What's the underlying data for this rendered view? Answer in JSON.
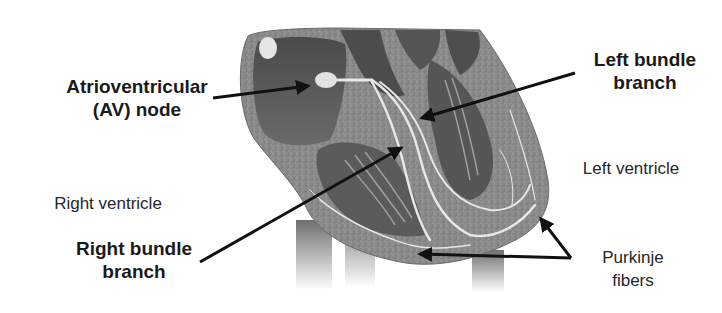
{
  "diagram": {
    "colors": {
      "background": "#ffffff",
      "label_text": "#1a1a1a",
      "arrow": "#111111",
      "heart_wall": "#8c8c8c",
      "heart_chamber": "#5a5a5a",
      "conduction_path": "#e6e6e6"
    },
    "labels": {
      "av_node": {
        "line1": "Atrioventricular",
        "line2": "(AV) node"
      },
      "left_bundle": {
        "line1": "Left bundle",
        "line2": "branch"
      },
      "left_ventricle": {
        "text": "Left ventricle"
      },
      "right_ventricle": {
        "text": "Right ventricle"
      },
      "right_bundle": {
        "line1": "Right bundle",
        "line2": "branch"
      },
      "purkinje": {
        "line1": "Purkinje",
        "line2": "fibers"
      }
    },
    "arrows": [
      {
        "name": "av-node-arrow",
        "from": [
          213,
          98
        ],
        "to": [
          310,
          86
        ]
      },
      {
        "name": "left-bundle-arrow",
        "from": [
          575,
          73
        ],
        "to": [
          420,
          118
        ]
      },
      {
        "name": "right-bundle-arrow",
        "from": [
          200,
          262
        ],
        "to": [
          403,
          147
        ]
      },
      {
        "name": "purkinje-arrow-upper",
        "from": [
          571,
          258
        ],
        "to": [
          540,
          217
        ]
      },
      {
        "name": "purkinje-arrow-lower",
        "from": [
          571,
          258
        ],
        "to": [
          418,
          254
        ]
      }
    ]
  }
}
